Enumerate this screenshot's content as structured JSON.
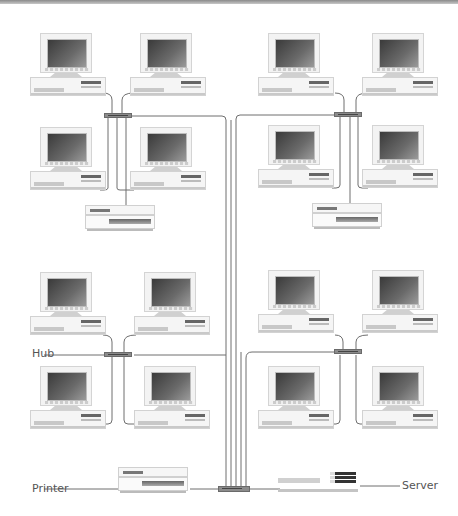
{
  "diagram": {
    "type": "network-topology",
    "labels": {
      "hub": "Hub",
      "printer": "Printer",
      "server": "Server"
    },
    "groups": [
      {
        "id": "top-left",
        "pcs": 4,
        "has_printer": true
      },
      {
        "id": "top-right",
        "pcs": 4,
        "has_printer": true
      },
      {
        "id": "bottom-left",
        "pcs": 4,
        "has_printer": false,
        "hub_labeled": true
      },
      {
        "id": "bottom-right",
        "pcs": 4,
        "has_printer": false
      }
    ],
    "central": {
      "hub": 1,
      "printer": 1,
      "server": 1
    },
    "colors": {
      "cable": "#6f6f6f",
      "hub": "#8b8b8b",
      "screen": "#4a4a4a",
      "chassis": "#f4f4f4"
    }
  }
}
